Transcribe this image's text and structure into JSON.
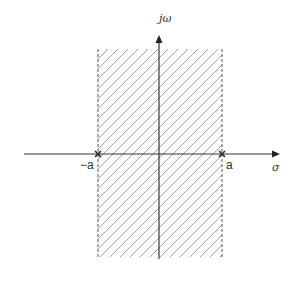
{
  "diagram": {
    "type": "s-plane region of convergence",
    "axes": {
      "vertical_label": "jω",
      "horizontal_label": "σ"
    },
    "points": [
      {
        "label": "−a",
        "marker": "×"
      },
      {
        "label": "a",
        "marker": "×"
      }
    ],
    "region": {
      "description": "vertical strip between −a and a (hatched)",
      "left_boundary": "−a",
      "right_boundary": "a",
      "boundary_style": "dashed"
    },
    "colors": {
      "axis": "#333333",
      "hatch": "#777777",
      "boundary": "#555555"
    }
  }
}
